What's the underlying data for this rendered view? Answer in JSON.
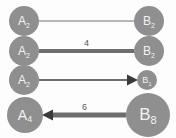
{
  "diagram": {
    "type": "graph-edge-comparison",
    "background_color": "#fdfdfd",
    "node_color": "#8f8f8f",
    "node_text_color": "#f2f2f2",
    "edge_color": "#6e6e6e",
    "arrow_color": "#3a3a3a",
    "label_color": "#5a5a5a",
    "rows": [
      {
        "id": "row-1",
        "source": {
          "base": "A",
          "subscript": "2",
          "text": "A2",
          "radius": 15,
          "cx": 24,
          "cy": 21
        },
        "target": {
          "base": "B",
          "subscript": "2",
          "text": "B2",
          "radius": 15,
          "cx": 149,
          "cy": 21
        },
        "edge": {
          "label": "",
          "thickness": 1,
          "arrow": "none",
          "direction": "undirected"
        }
      },
      {
        "id": "row-2",
        "source": {
          "base": "A",
          "subscript": "2",
          "text": "A2",
          "radius": 15,
          "cx": 24,
          "cy": 51
        },
        "target": {
          "base": "B",
          "subscript": "2",
          "text": "B2",
          "radius": 15,
          "cx": 149,
          "cy": 51
        },
        "edge": {
          "label": "4",
          "thickness": 4,
          "arrow": "none",
          "direction": "undirected"
        }
      },
      {
        "id": "row-3",
        "source": {
          "base": "A",
          "subscript": "2",
          "text": "A2",
          "radius": 15,
          "cx": 24,
          "cy": 80
        },
        "target": {
          "base": "B",
          "subscript": "1",
          "text": "B1",
          "radius": 10,
          "cx": 147,
          "cy": 80
        },
        "edge": {
          "label": "",
          "thickness": 2,
          "arrow": "right",
          "direction": "source-to-target"
        }
      },
      {
        "id": "row-4",
        "source": {
          "base": "A",
          "subscript": "4",
          "text": "A4",
          "radius": 18,
          "cx": 25,
          "cy": 115
        },
        "target": {
          "base": "B",
          "subscript": "8",
          "text": "B8",
          "radius": 22,
          "cx": 148,
          "cy": 115
        },
        "edge": {
          "label": "6",
          "thickness": 5,
          "arrow": "left",
          "direction": "target-to-source"
        }
      }
    ]
  }
}
